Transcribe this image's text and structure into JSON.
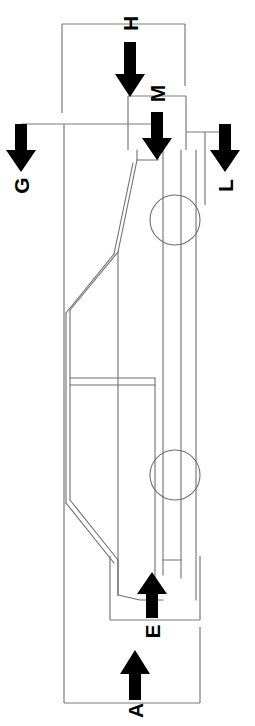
{
  "diagram": {
    "orientation": "vehicle drawn in side view, rotated 90 degrees (nose at top)",
    "line_color": "#7a7a7a",
    "arrow_color": "#000000",
    "background_color": "#ffffff",
    "dimensions": [
      {
        "id": "H",
        "label": "H",
        "arrow_direction": "down",
        "label_rotation": -90,
        "description": "overall height dimension arrow near vehicle front"
      },
      {
        "id": "M",
        "label": "M",
        "arrow_direction": "down",
        "label_rotation": -90,
        "description": "front overhang / nose dimension arrow"
      },
      {
        "id": "G",
        "label": "G",
        "arrow_direction": "down",
        "label_rotation": -90,
        "description": "left side extent dimension arrow"
      },
      {
        "id": "L",
        "label": "L",
        "arrow_direction": "down",
        "label_rotation": -90,
        "description": "right side extent dimension arrow"
      },
      {
        "id": "E",
        "label": "E",
        "arrow_direction": "up",
        "label_rotation": -90,
        "description": "rear overhang dimension arrow"
      },
      {
        "id": "A",
        "label": "A",
        "arrow_direction": "up",
        "label_rotation": -90,
        "description": "overall length dimension arrow"
      }
    ],
    "vehicle": {
      "wheels": [
        {
          "name": "front-wheel",
          "cx": 175,
          "cy": 220,
          "r": 25
        },
        {
          "name": "rear-wheel",
          "cx": 175,
          "cy": 475,
          "r": 25
        }
      ]
    }
  }
}
